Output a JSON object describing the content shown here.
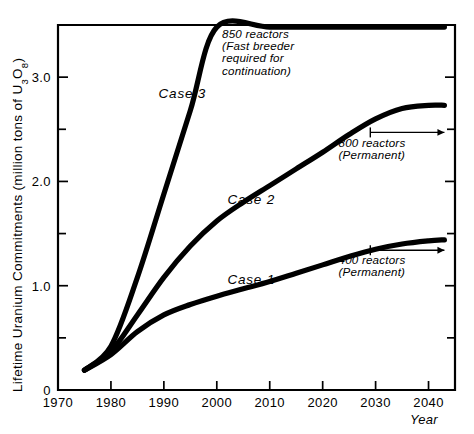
{
  "chart_data": {
    "type": "line",
    "title": "",
    "xlabel": "Year",
    "ylabel": "Lifetime Uranium Commitments (million tons of U₃O₈)",
    "ylabel_parts": {
      "main": "Lifetime Uranium Commitments (million tons of U",
      "sub1": "3",
      "mid": "O",
      "sub2": "8",
      "close": ")"
    },
    "xlim": [
      1970,
      2045
    ],
    "ylim": [
      0,
      3.5
    ],
    "xticks": [
      1970,
      1980,
      1990,
      2000,
      2010,
      2020,
      2030,
      2040
    ],
    "xtick_labels": [
      "1970",
      "1980",
      "1990",
      "2000",
      "2010",
      "2020",
      "2030",
      "2040"
    ],
    "yticks": [
      0,
      1.0,
      2.0,
      3.0
    ],
    "ytick_labels": [
      "0",
      "1.0",
      "2.0",
      "3.0"
    ],
    "yticks_minor": [
      0.5,
      1.5,
      2.5
    ],
    "grid": false,
    "legend": "inline-labels",
    "series": [
      {
        "name": "Case 1",
        "label": "Case 1",
        "label_x": 2002,
        "label_y": 1.02,
        "x": [
          1975,
          1980,
          1985,
          1990,
          1995,
          2000,
          2005,
          2010,
          2015,
          2020,
          2025,
          2030,
          2035,
          2040,
          2043
        ],
        "values": [
          0.19,
          0.34,
          0.56,
          0.72,
          0.82,
          0.9,
          0.97,
          1.04,
          1.12,
          1.2,
          1.28,
          1.35,
          1.4,
          1.43,
          1.44
        ]
      },
      {
        "name": "Case 2",
        "label": "Case 2",
        "label_x": 2002,
        "label_y": 1.78,
        "x": [
          1975,
          1980,
          1985,
          1990,
          1995,
          2000,
          2005,
          2010,
          2015,
          2020,
          2025,
          2030,
          2035,
          2040,
          2043
        ],
        "values": [
          0.19,
          0.37,
          0.72,
          1.08,
          1.38,
          1.62,
          1.8,
          1.96,
          2.12,
          2.28,
          2.45,
          2.6,
          2.7,
          2.73,
          2.73
        ]
      },
      {
        "name": "Case 3",
        "label": "Case 3",
        "label_x": 1989,
        "label_y": 2.8,
        "x": [
          1975,
          1980,
          1985,
          1990,
          1995,
          2000,
          2010,
          2020,
          2030,
          2040,
          2043
        ],
        "values": [
          0.19,
          0.42,
          1.08,
          1.88,
          2.68,
          3.48,
          3.48,
          3.48,
          3.48,
          3.48,
          3.48
        ]
      }
    ],
    "annotations": [
      {
        "id": "ann-850",
        "lines": [
          "850 reactors",
          "(Fast breeder",
          "required for",
          "continuation)"
        ],
        "x": 2001,
        "y": 3.38
      },
      {
        "id": "ann-800",
        "lines": [
          "800 reactors",
          "(Permanent)"
        ],
        "x": 2023,
        "y": 2.33,
        "arrow": {
          "x_start": 2029,
          "x_end": 2043,
          "y": 2.47
        }
      },
      {
        "id": "ann-400",
        "lines": [
          "400 reactors",
          "(Permanent)"
        ],
        "x": 2023,
        "y": 1.21,
        "arrow": {
          "x_start": 2029,
          "x_end": 2043,
          "y": 1.34
        }
      }
    ],
    "colors": {
      "line": "#000000",
      "axis": "#000000",
      "background": "#ffffff"
    }
  }
}
